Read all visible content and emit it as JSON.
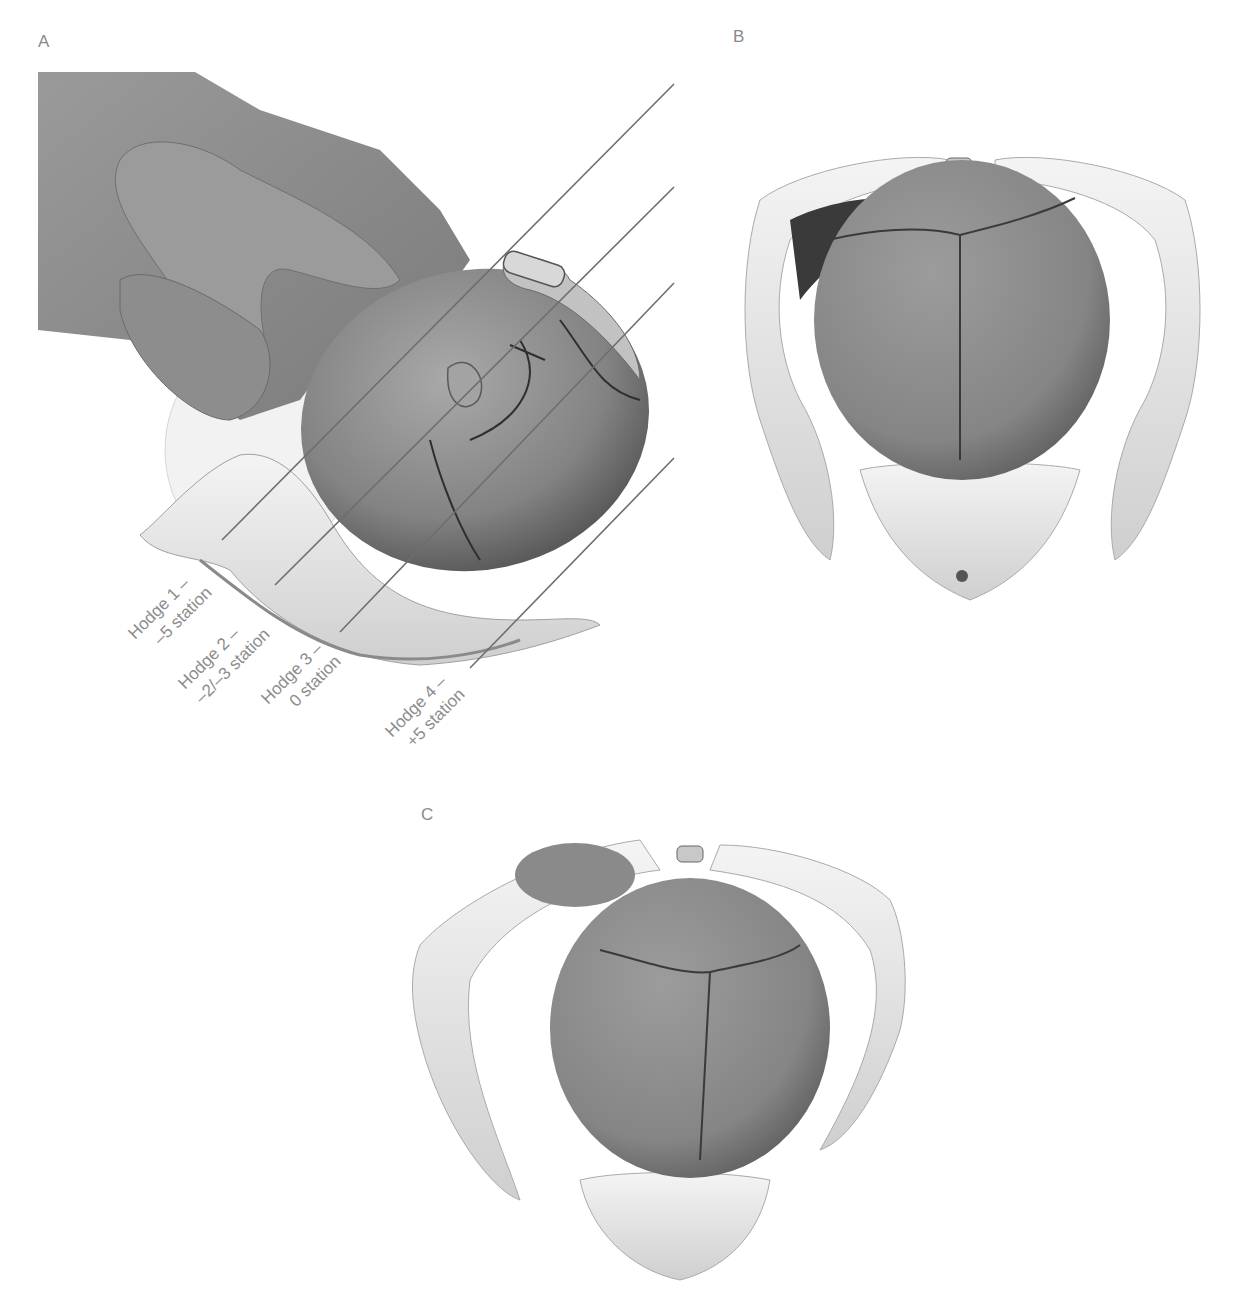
{
  "panels": {
    "a": {
      "letter": "A",
      "description": "Lateral view of fetal head descending through the pelvis with Hodge planes",
      "hodge_planes": [
        {
          "line1": "Hodge 1 –",
          "line2": "–5 station"
        },
        {
          "line1": "Hodge 2 –",
          "line2": "–2/–3 station"
        },
        {
          "line1": "Hodge 3 –",
          "line2": "0 station"
        },
        {
          "line1": "Hodge 4 –",
          "line2": "+5 station"
        }
      ]
    },
    "b": {
      "letter": "B",
      "description": "Superior view of fetal head engaged in pelvic inlet"
    },
    "c": {
      "letter": "C",
      "description": "Oblique superior view of fetal head within pelvis"
    }
  },
  "colors": {
    "label": "#8a8a8a",
    "skin": "#8f8f8f",
    "bone": "#e6e6e6",
    "line": "#6e6e6e"
  }
}
